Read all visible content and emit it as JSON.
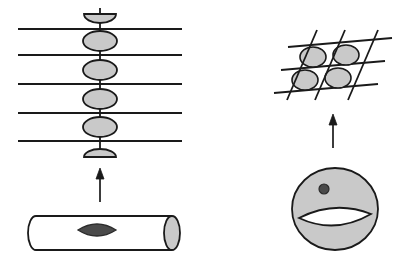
{
  "figure": {
    "background_color": "#ffffff",
    "stroke_color": "#1a1a1a",
    "fill_light_gray": "#c9c9c9",
    "fill_mid_gray": "#bdbdbd",
    "fill_dark_gray": "#4a4a4a",
    "fill_white": "#ffffff"
  },
  "left_panel": {
    "name": "chain-of-spheres-over-lines",
    "horizontal_lines": {
      "count": 5,
      "x_start": 18,
      "x_end": 182,
      "y_values": [
        29,
        55,
        84,
        113,
        141
      ],
      "stroke_width": 1.8
    },
    "vertical_axis": {
      "x": 100,
      "y_top": 8,
      "y_bottom": 158,
      "stroke_width": 1.8
    },
    "nodes": [
      {
        "shape": "half-ellipse-bottom",
        "cx": 100,
        "cy": 14,
        "rx": 16,
        "ry": 9
      },
      {
        "shape": "ellipse",
        "cx": 100,
        "cy": 41,
        "rx": 17,
        "ry": 10
      },
      {
        "shape": "ellipse",
        "cx": 100,
        "cy": 70,
        "rx": 17,
        "ry": 10
      },
      {
        "shape": "ellipse",
        "cx": 100,
        "cy": 99,
        "rx": 17,
        "ry": 10
      },
      {
        "shape": "ellipse",
        "cx": 100,
        "cy": 127,
        "rx": 17,
        "ry": 10
      },
      {
        "shape": "half-ellipse-top",
        "cx": 100,
        "cy": 157,
        "rx": 16,
        "ry": 8
      }
    ],
    "arrow": {
      "name": "left-up-arrow",
      "x": 100,
      "y_tail": 202,
      "y_head": 168,
      "head_width": 8,
      "head_length": 11
    },
    "cylinder": {
      "name": "cylinder-with-vanishing-cycle",
      "left_x": 28,
      "right_x": 172,
      "top_y": 216,
      "bottom_y": 250,
      "cap_rx": 8,
      "cap_ry": 17,
      "vanishing_cycle": {
        "cx": 97,
        "cy": 230,
        "rx": 19,
        "ry": 9
      }
    }
  },
  "right_panel": {
    "name": "lattice-over-torus",
    "lattice": {
      "shallow_lines": [
        {
          "x1": 288,
          "y1": 47,
          "x2": 392,
          "y2": 38
        },
        {
          "x1": 281,
          "y1": 70,
          "x2": 385,
          "y2": 61
        },
        {
          "x1": 274,
          "y1": 93,
          "x2": 378,
          "y2": 84
        }
      ],
      "steep_lines": [
        {
          "x1": 287,
          "y1": 100,
          "x2": 317,
          "y2": 30
        },
        {
          "x1": 315,
          "y1": 100,
          "x2": 345,
          "y2": 30
        },
        {
          "x1": 348,
          "y1": 100,
          "x2": 378,
          "y2": 30
        }
      ],
      "cells": [
        {
          "cx": 313,
          "cy": 57,
          "rx": 13,
          "ry": 10
        },
        {
          "cx": 346,
          "cy": 55,
          "rx": 13,
          "ry": 10
        },
        {
          "cx": 305,
          "cy": 80,
          "rx": 13,
          "ry": 10
        },
        {
          "cx": 338,
          "cy": 78,
          "rx": 13,
          "ry": 10
        }
      ]
    },
    "arrow": {
      "name": "right-up-arrow",
      "x": 333,
      "y_tail": 148,
      "y_head": 114,
      "head_width": 8,
      "head_length": 11
    },
    "torus": {
      "name": "torus-with-node",
      "cx": 335,
      "cy": 209,
      "rx": 43,
      "ry": 41,
      "hole": {
        "cx": 335,
        "cy": 216,
        "rx": 36,
        "ry": 13
      },
      "node_dot": {
        "cx": 324,
        "cy": 189,
        "r": 5
      }
    }
  }
}
